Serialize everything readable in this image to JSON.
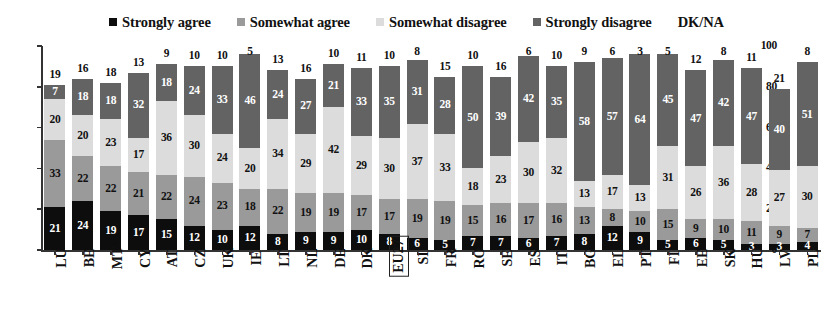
{
  "legend": {
    "items": [
      {
        "label": "Strongly agree",
        "color": "#0d0d0d",
        "marker": true
      },
      {
        "label": "Somewhat agree",
        "color": "#9a9a9a",
        "marker": true
      },
      {
        "label": "Somewhat disagree",
        "color": "#dcdcdc",
        "marker": true
      },
      {
        "label": "Strongly disagree",
        "color": "#636363",
        "marker": true
      },
      {
        "label": "DK/NA",
        "color": "#ffffff",
        "marker": false
      }
    ]
  },
  "axis": {
    "y_ticks": [
      "0",
      "20",
      "40",
      "60",
      "80",
      "100"
    ],
    "y_min": 0,
    "y_max": 100
  },
  "chart_data": {
    "type": "bar",
    "stacked": true,
    "title": "",
    "xlabel": "",
    "ylabel": "",
    "ylim": [
      0,
      100
    ],
    "grid": false,
    "legend_position": "top",
    "categories": [
      "LU",
      "BE",
      "MT",
      "CY",
      "AT",
      "CZ",
      "UK",
      "IE",
      "LT",
      "NL",
      "DE",
      "DK",
      "EU27",
      "SI",
      "FR",
      "RO",
      "SE",
      "ES",
      "IT",
      "BG",
      "EL",
      "PT",
      "FI",
      "EE",
      "SK",
      "HU",
      "LV",
      "PL"
    ],
    "highlighted_category": "EU27",
    "series": [
      {
        "name": "Strongly agree",
        "color": "#0d0d0d",
        "values": [
          21,
          24,
          19,
          17,
          15,
          12,
          10,
          12,
          8,
          9,
          9,
          10,
          8,
          6,
          5,
          7,
          7,
          6,
          7,
          8,
          12,
          9,
          5,
          6,
          5,
          3,
          3,
          4
        ]
      },
      {
        "name": "Somewhat agree",
        "color": "#9a9a9a",
        "values": [
          33,
          22,
          22,
          21,
          22,
          24,
          23,
          18,
          22,
          19,
          19,
          17,
          17,
          19,
          19,
          15,
          16,
          17,
          16,
          13,
          8,
          10,
          15,
          9,
          10,
          11,
          9,
          7
        ]
      },
      {
        "name": "Somewhat disagree",
        "color": "#dcdcdc",
        "values": [
          20,
          20,
          23,
          17,
          36,
          30,
          24,
          20,
          34,
          29,
          42,
          29,
          30,
          37,
          33,
          18,
          23,
          30,
          32,
          13,
          17,
          13,
          31,
          26,
          36,
          28,
          27,
          30
        ]
      },
      {
        "name": "Strongly disagree",
        "color": "#636363",
        "values": [
          7,
          18,
          18,
          32,
          18,
          24,
          33,
          46,
          24,
          27,
          21,
          33,
          35,
          31,
          28,
          50,
          39,
          42,
          35,
          58,
          57,
          64,
          45,
          47,
          42,
          47,
          40,
          51
        ]
      },
      {
        "name": "DK/NA",
        "color": "#ffffff",
        "values": [
          19,
          16,
          18,
          13,
          9,
          10,
          10,
          5,
          13,
          16,
          10,
          11,
          10,
          8,
          15,
          10,
          16,
          6,
          10,
          9,
          6,
          3,
          5,
          12,
          8,
          11,
          21,
          8
        ]
      }
    ]
  }
}
